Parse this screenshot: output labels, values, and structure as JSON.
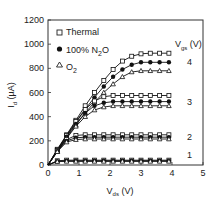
{
  "chart_data": {
    "type": "line",
    "title": "",
    "xlabel": "V_ds (V)",
    "ylabel": "I_d (µA)",
    "xlim": [
      0,
      5
    ],
    "ylim": [
      0,
      1200
    ],
    "xticks": [
      0,
      1,
      2,
      3,
      4,
      5
    ],
    "yticks": [
      0,
      200,
      400,
      600,
      800,
      1000,
      1200
    ],
    "legend_position": "upper-left inside",
    "legend": [
      "Thermal",
      "100% N2O",
      "O2"
    ],
    "annotation_title": "V_gs (V)",
    "vgs_labels": [
      "1",
      "2",
      "3",
      "4"
    ],
    "x": [
      0,
      0.3,
      0.6,
      0.9,
      1.2,
      1.5,
      1.8,
      2.1,
      2.4,
      2.7,
      3.0,
      3.3,
      3.6,
      3.9
    ],
    "series": [
      {
        "name": "Thermal Vgs=4",
        "marker": "square",
        "values": [
          0,
          130,
          250,
          370,
          490,
          600,
          700,
          790,
          860,
          900,
          920,
          925,
          925,
          925
        ]
      },
      {
        "name": "100% N2O Vgs=4",
        "marker": "circle",
        "values": [
          0,
          125,
          240,
          350,
          460,
          560,
          650,
          730,
          790,
          830,
          850,
          850,
          850,
          850
        ]
      },
      {
        "name": "O2 Vgs=4",
        "marker": "triangle",
        "values": [
          0,
          115,
          225,
          330,
          430,
          520,
          600,
          670,
          730,
          770,
          780,
          780,
          780,
          780
        ]
      },
      {
        "name": "Thermal Vgs=3",
        "marker": "square",
        "values": [
          0,
          125,
          245,
          360,
          460,
          530,
          565,
          575,
          575,
          575,
          575,
          575,
          575,
          575
        ]
      },
      {
        "name": "100% N2O Vgs=3",
        "marker": "circle",
        "values": [
          0,
          120,
          235,
          340,
          430,
          490,
          515,
          525,
          525,
          525,
          525,
          525,
          525,
          525
        ]
      },
      {
        "name": "O2 Vgs=3",
        "marker": "triangle",
        "values": [
          0,
          110,
          220,
          320,
          400,
          455,
          480,
          490,
          490,
          490,
          490,
          490,
          490,
          490
        ]
      },
      {
        "name": "Thermal Vgs=2",
        "marker": "square",
        "values": [
          0,
          120,
          210,
          245,
          250,
          250,
          250,
          250,
          250,
          250,
          250,
          250,
          250,
          250
        ]
      },
      {
        "name": "100% N2O Vgs=2",
        "marker": "circle",
        "values": [
          0,
          115,
          200,
          225,
          230,
          230,
          230,
          230,
          230,
          230,
          230,
          230,
          230,
          230
        ]
      },
      {
        "name": "O2 Vgs=2",
        "marker": "triangle",
        "values": [
          0,
          110,
          190,
          210,
          215,
          215,
          215,
          215,
          215,
          215,
          215,
          215,
          215,
          215
        ]
      },
      {
        "name": "Thermal Vgs=1",
        "marker": "square",
        "values": [
          0,
          35,
          40,
          40,
          40,
          40,
          40,
          40,
          40,
          40,
          40,
          40,
          40,
          40
        ]
      },
      {
        "name": "100% N2O Vgs=1",
        "marker": "circle",
        "values": [
          0,
          32,
          35,
          35,
          35,
          35,
          35,
          35,
          35,
          35,
          35,
          35,
          35,
          35
        ]
      },
      {
        "name": "O2 Vgs=1",
        "marker": "triangle",
        "values": [
          0,
          28,
          30,
          30,
          30,
          30,
          30,
          30,
          30,
          30,
          30,
          30,
          30,
          30
        ]
      }
    ]
  },
  "labels": {
    "legend_thermal": "Thermal",
    "legend_n2o_pre": "100% N",
    "legend_n2o_sub": "2",
    "legend_n2o_post": "O",
    "legend_o2_pre": "O",
    "legend_o2_sub": "2",
    "vgs_main": "V",
    "vgs_sub": "gs",
    "vgs_unit": " (V)",
    "xlabel_main": "V",
    "xlabel_sub": "ds",
    "xlabel_unit": " (V)",
    "ylabel_main": "I",
    "ylabel_sub": "d",
    "ylabel_unit": " (µA)"
  }
}
